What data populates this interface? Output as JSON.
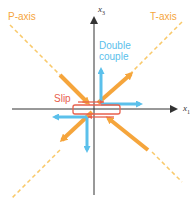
{
  "colors": {
    "p_axis": "#f5a53c",
    "t_axis": "#f5a53c",
    "dashed": "#f9c96a",
    "double_couple": "#5bc0eb",
    "slip": "#e8604c",
    "axes": "#333333"
  },
  "labels": {
    "p_axis": "P-axis",
    "t_axis": "T-axis",
    "double_couple_line1": "Double",
    "double_couple_line2": "couple",
    "slip": "Slip",
    "x3": "x",
    "x3_sub": "3",
    "x1": "x",
    "x1_sub": "1"
  }
}
